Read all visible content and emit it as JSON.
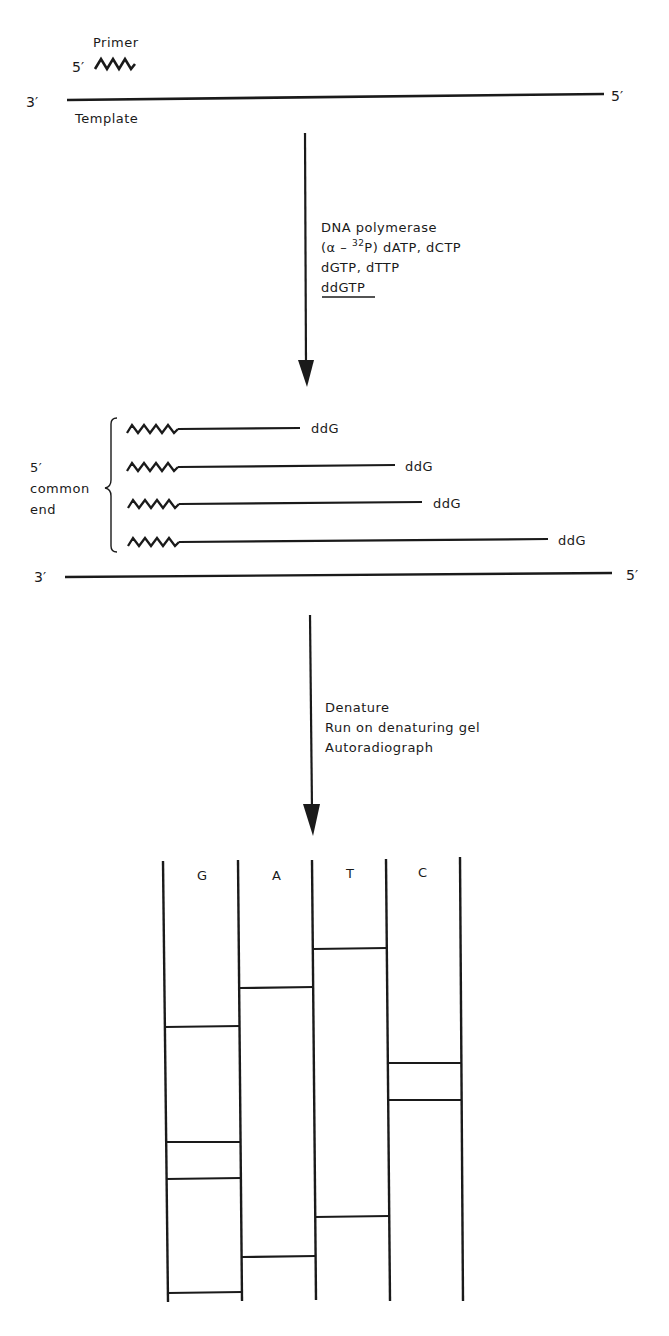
{
  "step1": {
    "primer_label": "Primer",
    "primer_5prime": "5′",
    "template_3prime": "3′",
    "template_5prime": "5′",
    "template_label": "Template"
  },
  "reaction": {
    "lines": [
      "DNA polymerase",
      "(α – ",
      "32",
      "P) dATP, dCTP",
      "dGTP, dTTP",
      "ddGTP"
    ]
  },
  "step2": {
    "common_end_label": [
      "5′",
      "common",
      "end"
    ],
    "fragments": [
      {
        "end_x": 300,
        "label": "ddG"
      },
      {
        "end_x": 395,
        "label": "ddG"
      },
      {
        "end_x": 422,
        "label": "ddG"
      },
      {
        "end_x": 548,
        "label": "ddG"
      }
    ],
    "template_3prime": "3′",
    "template_5prime": "5′"
  },
  "processing": {
    "lines": [
      "Denature",
      "Run on denaturing gel",
      "Autoradiograph"
    ]
  },
  "gel": {
    "lanes": [
      {
        "label": "G",
        "bands_y": [
          1027,
          1142,
          1179,
          1292
        ]
      },
      {
        "label": "A",
        "bands_y": [
          987,
          1256
        ]
      },
      {
        "label": "T",
        "bands_y": [
          948,
          1216
        ]
      },
      {
        "label": "C",
        "bands_y": [
          1063,
          1100
        ]
      }
    ]
  },
  "colors": {
    "ink": "#1a1a1a",
    "background": "#ffffff"
  }
}
